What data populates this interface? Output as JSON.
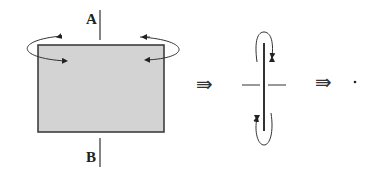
{
  "diagram": {
    "label_top": "A",
    "label_bottom": "B",
    "implies_1": "⇛",
    "implies_2": "⇛",
    "rect_fill": "#d3d3d3",
    "stroke": "#333333"
  }
}
